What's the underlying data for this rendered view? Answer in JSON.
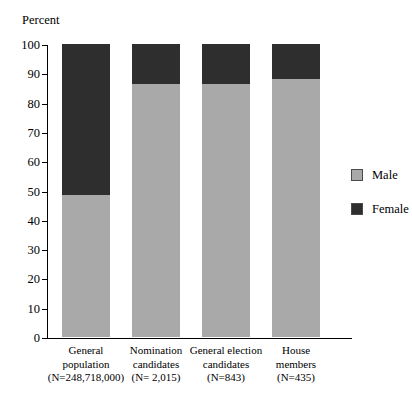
{
  "chart_data": {
    "type": "bar",
    "title": "",
    "subtitle": "",
    "xlabel": "",
    "ylabel": "Percent",
    "ylim": [
      0,
      100
    ],
    "ytick_labels": [
      "0",
      "10",
      "20",
      "30",
      "40",
      "50",
      "60",
      "70",
      "80",
      "90",
      "100"
    ],
    "ytick_values": [
      0,
      10,
      20,
      30,
      40,
      50,
      60,
      70,
      80,
      90,
      100
    ],
    "grid": false,
    "stacked": true,
    "legend_position": "right",
    "categories": [
      "General population",
      "Nomination candidates",
      "General election candidates",
      "House members"
    ],
    "category_lines": [
      [
        "General",
        "population",
        "(N=248,718,000)"
      ],
      [
        "Nomination",
        "candidates",
        "(N= 2,015)"
      ],
      [
        "General election",
        "candidates",
        "(N=843)"
      ],
      [
        "House",
        "members",
        "(N=435)"
      ]
    ],
    "series": [
      {
        "name": "Male",
        "color": "#a9a9a9",
        "values": [
          48.6,
          86.2,
          86.2,
          88.2
        ]
      },
      {
        "name": "Female",
        "color": "#2e2e2e",
        "values": [
          51.4,
          13.8,
          13.8,
          11.8
        ]
      }
    ]
  },
  "legend": {
    "items": [
      {
        "label": "Male",
        "color": "#a9a9a9"
      },
      {
        "label": "Female",
        "color": "#2e2e2e"
      }
    ]
  }
}
